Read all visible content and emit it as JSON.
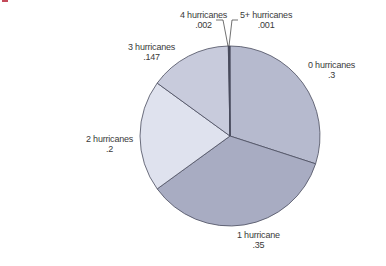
{
  "chart_data": {
    "type": "pie",
    "title": "",
    "start_angle_deg": 0,
    "direction": "clockwise",
    "center": [
      230,
      136
    ],
    "radius": 90,
    "stroke": "#4a4d5e",
    "slices": [
      {
        "label": "0 hurricanes",
        "value_text": ".3",
        "value": 0.3,
        "color": "#b6bace",
        "label_pos": [
          326,
          63
        ]
      },
      {
        "label": "1 hurricane",
        "value_text": ".35",
        "value": 0.35,
        "color": "#a8acc2",
        "label_pos": [
          256,
          231
        ]
      },
      {
        "label": "2 hurricanes",
        "value_text": ".2",
        "value": 0.2,
        "color": "#dfe2ee",
        "label_pos": [
          80,
          133
        ]
      },
      {
        "label": "3 hurricanes",
        "value_text": ".147",
        "value": 0.147,
        "color": "#c8cbdc",
        "label_pos": [
          134,
          42
        ]
      },
      {
        "label": "4 hurricanes",
        "value_text": ".002",
        "value": 0.002,
        "color": "#2e3040",
        "label_pos": [
          180,
          8
        ]
      },
      {
        "label": "5+ hurricanes",
        "value_text": ".001",
        "value": 0.001,
        "color": "#2e3040",
        "label_pos": [
          240,
          8
        ]
      }
    ]
  },
  "labels": {
    "s0": {
      "name": "0 hurricanes",
      "value": ".3"
    },
    "s1": {
      "name": "1 hurricane",
      "value": ".35"
    },
    "s2": {
      "name": "2 hurricanes",
      "value": ".2"
    },
    "s3": {
      "name": "3 hurricanes",
      "value": ".147"
    },
    "s4": {
      "name": "4 hurricanes",
      "value": ".002"
    },
    "s5": {
      "name": "5+ hurricanes",
      "value": ".001"
    }
  }
}
